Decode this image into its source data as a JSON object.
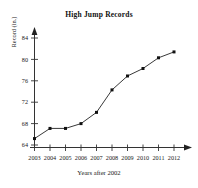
{
  "chart_data": {
    "type": "line",
    "title": "High Jump Records",
    "xlabel": "Years after 2002",
    "ylabel": "Record (in.)",
    "categories": [
      "2003",
      "2004",
      "2005",
      "2006",
      "2007",
      "2008",
      "2009",
      "2010",
      "2011",
      "2012"
    ],
    "x": [
      2003,
      2004,
      2005,
      2006,
      2007,
      2008,
      2009,
      2010,
      2011,
      2012
    ],
    "values": [
      65.2,
      67.1,
      67.1,
      68.0,
      70.1,
      74.3,
      76.9,
      78.3,
      80.3,
      81.4
    ],
    "series": [
      {
        "name": "High Jump Record",
        "values": [
          65.2,
          67.1,
          67.1,
          68.0,
          70.1,
          74.3,
          76.9,
          78.3,
          80.3,
          81.4
        ]
      }
    ],
    "yticks": [
      64,
      68,
      72,
      76,
      80,
      84
    ],
    "ytick_labels": [
      "64",
      "68",
      "72",
      "76",
      "80",
      "84"
    ],
    "xtick_labels": [
      "2003",
      "2004",
      "2005",
      "2006",
      "2007",
      "2008",
      "2009",
      "2010",
      "2011",
      "2012"
    ],
    "ylim": [
      63.0,
      85.6
    ],
    "xlim": [
      2002.7,
      2012.9
    ],
    "grid": false,
    "legend": false,
    "legend_position": "none",
    "marker": "square",
    "line_color": "#222222",
    "marker_color": "#111111",
    "axis_color": "#333333",
    "background_color": "#ffffff"
  }
}
